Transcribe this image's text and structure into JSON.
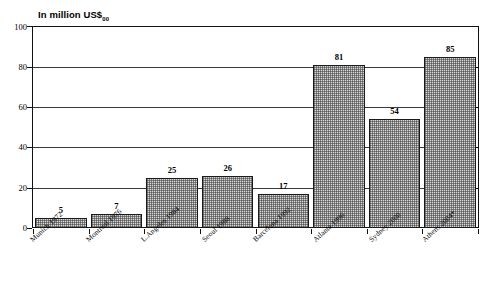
{
  "chart_data": {
    "type": "bar",
    "title": "In million US$",
    "title_subscript": "00",
    "xlabel": "",
    "ylabel": "",
    "ylim": [
      0,
      100
    ],
    "yticks": [
      0,
      20,
      40,
      60,
      80,
      100
    ],
    "grid": true,
    "legend": "none",
    "categories": [
      "Munich 1972",
      "Montreal 1976",
      "L.Angeles 1984",
      "Seoul 1988",
      "Barcelona 1992",
      "Atlanta 1996",
      "Sydney 2000",
      "Athens 2004*"
    ],
    "values": [
      5,
      7,
      25,
      26,
      17,
      81,
      54,
      85
    ],
    "data_labels": [
      "5",
      "7",
      "25",
      "26",
      "17",
      "81",
      "54",
      "85"
    ],
    "bar_fill": "#d8d8d8",
    "bar_border": "#1a1a1a",
    "axis_color": "#111111",
    "grid_color": "#3a3a3a",
    "annotations": [
      "* indicates estimated/projected figure"
    ]
  },
  "axis": {
    "y_tick_labels": [
      "0",
      "20",
      "40",
      "60",
      "80",
      "100"
    ]
  }
}
